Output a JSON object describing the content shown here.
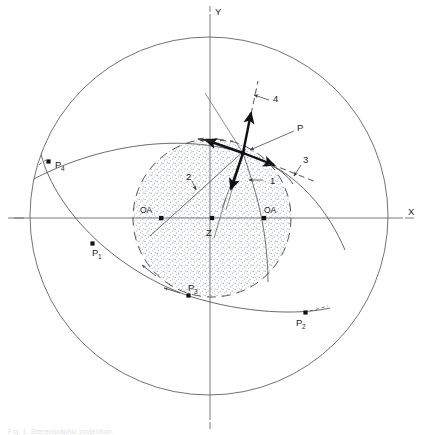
{
  "figure": {
    "type": "stereographic-projection",
    "background_color": "#ffffff",
    "line_color": "#555555",
    "bold_line_color": "#111111",
    "stipple_color": "#9aa2b0",
    "text_color": "#1d1d1d"
  },
  "axes": {
    "x_label": "X",
    "y_label": "Y",
    "center_label": "Z"
  },
  "points": [
    {
      "id": "P1",
      "label": "P",
      "subscript": "1",
      "x": 93,
      "y": 244
    },
    {
      "id": "P2",
      "label": "P",
      "subscript": "2",
      "x": 306,
      "y": 313
    },
    {
      "id": "P3",
      "label": "P",
      "subscript": "3",
      "x": 189,
      "y": 296
    },
    {
      "id": "P4",
      "label": "P",
      "subscript": "4",
      "x": 49,
      "y": 162
    },
    {
      "id": "P",
      "label": "P",
      "subscript": "",
      "x": 243,
      "y": 153
    }
  ],
  "optic_axes": [
    {
      "id": "OA-left",
      "label": "OA",
      "x": 161,
      "y": 218
    },
    {
      "id": "OA-right",
      "label": "OA",
      "x": 264,
      "y": 218
    }
  ],
  "numbered_labels": [
    {
      "id": "label-1",
      "text": "1",
      "x": 268,
      "y": 182
    },
    {
      "id": "label-2",
      "text": "2",
      "x": 189,
      "y": 176
    },
    {
      "id": "label-3",
      "text": "3",
      "x": 304,
      "y": 160
    },
    {
      "id": "label-4",
      "text": "4",
      "x": 275,
      "y": 99
    }
  ],
  "geometry": {
    "outer_circle": {
      "cx": 209,
      "cy": 216,
      "r": 179
    },
    "inner_circle": {
      "cx": 212,
      "cy": 218,
      "r": 79,
      "style": "dashed"
    },
    "center": {
      "cx": 212,
      "cy": 218
    }
  },
  "caption": "Fig. 1. Stereographic projection."
}
